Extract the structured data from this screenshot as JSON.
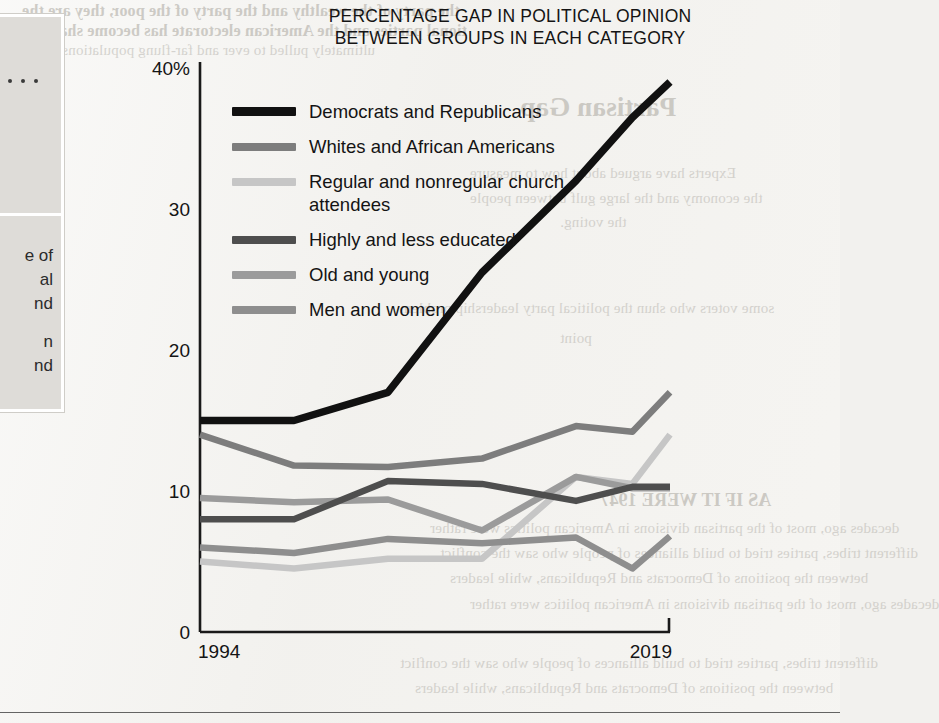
{
  "chart_title": {
    "line1": "PERCENTAGE GAP IN POLITICAL OPINION",
    "line2": "BETWEEN GROUPS IN EACH CATEGORY"
  },
  "sidebar": {
    "fragments": [
      "e of",
      "al",
      "nd",
      "n",
      "nd"
    ],
    "dot_count": 4
  },
  "bleed_text": {
    "top1": "the party of the wealthy and the party of the poor, they are the",
    "top2": "tional parties and the American electorate has become sharply",
    "top3": "ultimately pulled to ever and far-flung populations.",
    "heading": "Partisan Gap",
    "p1": "Experts have argued about how to measure",
    "p2": "the economy and the large gulf between people",
    "p3": "the voting.",
    "p4": "some voters who shun the political party leadership problem",
    "p5": "point",
    "sub": "AS IF IT WERE 1947",
    "b1": "decades ago, most of the partisan divisions in American politics were rather",
    "b2": "different tribes, parties tried to build alliances of people who saw the conflict",
    "b3": "between the positions of Democrats and Republicans, while leaders"
  },
  "chart_data": {
    "type": "line",
    "title": "PERCENTAGE GAP IN POLITICAL OPINION BETWEEN GROUPS IN EACH CATEGORY",
    "xlabel": "",
    "ylabel": "",
    "x": [
      1994,
      1999,
      2004,
      2009,
      2014,
      2017,
      2019
    ],
    "xlim": [
      1994,
      2019
    ],
    "ylim": [
      0,
      40
    ],
    "yticks": [
      0,
      10,
      20,
      30,
      40
    ],
    "ytick_labels": [
      "0",
      "10",
      "20",
      "30",
      "40%"
    ],
    "xtick_labels": [
      "1994",
      "2019"
    ],
    "grid": false,
    "legend_position": "upper-left-inside",
    "series": [
      {
        "name": "Democrats and Republicans",
        "color": "#111111",
        "values": [
          15.0,
          15.0,
          17.0,
          25.5,
          32.0,
          36.5,
          39.0
        ]
      },
      {
        "name": "Whites and African Americans",
        "color": "#7d7d7d",
        "values": [
          14.0,
          11.8,
          11.7,
          12.3,
          14.6,
          14.2,
          17.0
        ]
      },
      {
        "name": "Regular and nonregular church attendees",
        "color": "#c6c6c6",
        "values": [
          5.0,
          4.5,
          5.2,
          5.2,
          11.0,
          10.5,
          14.0
        ]
      },
      {
        "name": "Highly and less educated",
        "color": "#4e4e4e",
        "values": [
          8.0,
          8.0,
          10.7,
          10.5,
          9.3,
          10.3,
          10.3
        ]
      },
      {
        "name": "Old and young",
        "color": "#9b9b9b",
        "values": [
          9.5,
          9.2,
          9.4,
          7.2,
          11.0,
          10.2,
          10.2
        ]
      },
      {
        "name": "Men and women",
        "color": "#8e8e8e",
        "values": [
          6.0,
          5.6,
          6.6,
          6.3,
          6.7,
          4.5,
          6.8
        ]
      }
    ]
  }
}
